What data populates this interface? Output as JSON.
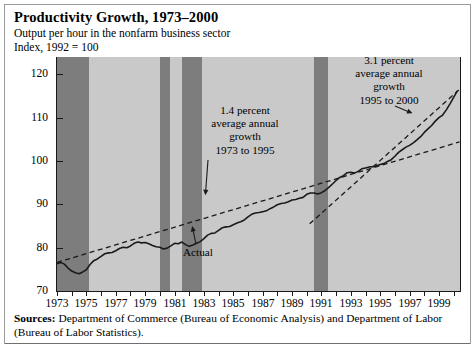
{
  "title": "Productivity Growth, 1973–2000",
  "subtitle1": "Output per hour in the nonfarm business sector",
  "subtitle2": "Index, 1992 = 100",
  "sources": {
    "label": "Sources:",
    "text": " Department of Commerce (Bureau of Economic Analysis) and Department of Labor (Bureau of Labor Statistics)."
  },
  "annotations": {
    "trend_early": "1.4 percent\naverage annual\ngrowth\n1973 to 1995",
    "trend_late": "3.1 percent\naverage annual\ngrowth\n1995 to 2000",
    "actual": "Actual"
  },
  "colors": {
    "plot_background": "#c9c9c9",
    "recession_band": "#7d7d7d",
    "series_line": "#1a1a1a",
    "trend_line": "#1a1a1a",
    "axis": "#1a1a1a",
    "frame_border": "#9a9a9a"
  },
  "chart_data": {
    "type": "line",
    "title": "Productivity Growth, 1973–2000",
    "subtitle": "Output per hour in the nonfarm business sector",
    "xlabel": "",
    "ylabel": "Index, 1992 = 100",
    "grid": false,
    "legend": "none",
    "xlim": [
      1973,
      2000.5
    ],
    "ylim": [
      70,
      124
    ],
    "yticks": [
      70,
      80,
      90,
      100,
      110,
      120
    ],
    "xticks": [
      1973,
      1974,
      1975,
      1976,
      1977,
      1978,
      1979,
      1980,
      1981,
      1982,
      1983,
      1984,
      1985,
      1986,
      1987,
      1988,
      1989,
      1990,
      1991,
      1992,
      1993,
      1994,
      1995,
      1996,
      1997,
      1998,
      1999,
      2000
    ],
    "xtick_labels": [
      "1973",
      "",
      "1975",
      "",
      "1977",
      "",
      "1979",
      "",
      "1981",
      "",
      "1983",
      "",
      "1985",
      "",
      "1987",
      "",
      "1989",
      "",
      "1991",
      "",
      "1993",
      "",
      "1995",
      "",
      "1997",
      "",
      "1999",
      ""
    ],
    "shaded_regions": [
      {
        "label": "recession 1973-75",
        "x0": 1973.0,
        "x1": 1975.2
      },
      {
        "label": "recession 1980",
        "x0": 1980.0,
        "x1": 1980.7
      },
      {
        "label": "recession 1981-82",
        "x0": 1981.5,
        "x1": 1982.9
      },
      {
        "label": "recession 1990-91",
        "x0": 1990.5,
        "x1": 1991.45
      }
    ],
    "series": [
      {
        "name": "Actual",
        "style": "solid",
        "x": [
          1973.0,
          1973.25,
          1973.5,
          1973.75,
          1974.0,
          1974.25,
          1974.5,
          1974.75,
          1975.0,
          1975.25,
          1975.5,
          1975.75,
          1976.0,
          1976.25,
          1976.5,
          1976.75,
          1977.0,
          1977.25,
          1977.5,
          1977.75,
          1978.0,
          1978.25,
          1978.5,
          1978.75,
          1979.0,
          1979.25,
          1979.5,
          1979.75,
          1980.0,
          1980.25,
          1980.5,
          1980.75,
          1981.0,
          1981.25,
          1981.5,
          1981.75,
          1982.0,
          1982.25,
          1982.5,
          1982.75,
          1983.0,
          1983.25,
          1983.5,
          1983.75,
          1984.0,
          1984.25,
          1984.5,
          1984.75,
          1985.0,
          1985.25,
          1985.5,
          1985.75,
          1986.0,
          1986.25,
          1986.5,
          1986.75,
          1987.0,
          1987.25,
          1987.5,
          1987.75,
          1988.0,
          1988.25,
          1988.5,
          1988.75,
          1989.0,
          1989.25,
          1989.5,
          1989.75,
          1990.0,
          1990.25,
          1990.5,
          1990.75,
          1991.0,
          1991.25,
          1991.5,
          1991.75,
          1992.0,
          1992.25,
          1992.5,
          1992.75,
          1993.0,
          1993.25,
          1993.5,
          1993.75,
          1994.0,
          1994.25,
          1994.5,
          1994.75,
          1995.0,
          1995.25,
          1995.5,
          1995.75,
          1996.0,
          1996.25,
          1996.5,
          1996.75,
          1997.0,
          1997.25,
          1997.5,
          1997.75,
          1998.0,
          1998.25,
          1998.5,
          1998.75,
          1999.0,
          1999.25,
          1999.5,
          1999.75,
          2000.0,
          2000.25
        ],
        "y": [
          76.3,
          76.6,
          76.2,
          75.3,
          74.6,
          74.2,
          74.0,
          74.4,
          74.9,
          76.1,
          77.0,
          77.4,
          78.0,
          78.6,
          78.8,
          78.9,
          79.3,
          79.8,
          80.1,
          80.0,
          80.4,
          81.0,
          81.3,
          81.1,
          81.2,
          80.9,
          80.5,
          80.2,
          80.1,
          79.7,
          79.9,
          80.4,
          81.0,
          80.9,
          81.3,
          80.7,
          80.3,
          80.6,
          81.0,
          81.4,
          82.1,
          82.9,
          83.3,
          83.4,
          84.0,
          84.6,
          84.8,
          84.9,
          85.3,
          85.7,
          86.0,
          86.4,
          87.1,
          87.7,
          88.0,
          88.1,
          88.3,
          88.5,
          89.0,
          89.4,
          89.9,
          90.2,
          90.3,
          90.6,
          91.0,
          91.1,
          91.4,
          91.6,
          92.3,
          92.6,
          92.6,
          92.4,
          92.7,
          93.2,
          93.9,
          94.7,
          95.5,
          96.2,
          96.6,
          97.3,
          97.4,
          97.2,
          97.6,
          98.2,
          98.4,
          98.6,
          98.7,
          98.9,
          99.2,
          99.4,
          99.9,
          100.3,
          101.1,
          102.0,
          102.6,
          103.2,
          103.6,
          104.2,
          104.9,
          105.6,
          106.6,
          107.4,
          108.2,
          109.2,
          110.0,
          110.6,
          111.8,
          113.2,
          114.7,
          116.2
        ]
      },
      {
        "name": "1.4 percent average annual growth 1973 to 1995",
        "style": "dashed",
        "x": [
          1973.0,
          2000.4
        ],
        "y": [
          76.6,
          104.4
        ]
      },
      {
        "name": "3.1 percent average annual growth 1995 to 2000",
        "style": "dashed",
        "x": [
          1990.2,
          2000.35
        ],
        "y": [
          85.5,
          116.4
        ]
      }
    ],
    "arrow_annotations": [
      {
        "text": "1.4 percent average annual growth 1973 to 1995",
        "points_to": [
          1983.1,
          92.1
        ]
      },
      {
        "text": "3.1 percent average annual growth 1995 to 2000",
        "points_to": [
          1997.2,
          111.0
        ]
      },
      {
        "text": "Actual",
        "points_to": [
          1982.2,
          85.0
        ]
      }
    ]
  }
}
